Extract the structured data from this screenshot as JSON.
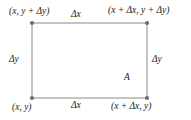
{
  "figure": {
    "name": "rectangle-area-diagram",
    "background_color": "#ffffff",
    "line_color": "#8a8a8a",
    "dot_color": "#6e6e6e",
    "text_color": "#1a1a1a"
  },
  "corners": {
    "top_left": "(x, y + Δy)",
    "top_right": "(x + Δx, y + Δy)",
    "bottom_left": "(x, y)",
    "bottom_right": "(x + Δx, y)"
  },
  "edges": {
    "top": "Δx",
    "bottom": "Δx",
    "left": "Δy",
    "right": "Δy"
  },
  "interior": {
    "area_label": "A"
  },
  "geometry": {
    "left": 32,
    "right": 147,
    "top": 23,
    "bottom": 98,
    "dot_radius": 2.1,
    "stroke_width": 1
  }
}
